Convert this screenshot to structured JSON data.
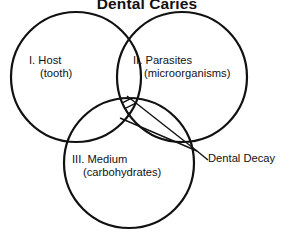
{
  "figure": {
    "title": "Dental Caries",
    "background_color": "#ffffff",
    "stroke_color": "#111111",
    "type": "venn-diagram-3-set"
  },
  "sets": [
    {
      "id": "host",
      "roman": "I.",
      "name": "Host",
      "detail": "(tooth)",
      "label_line1": "I. Host",
      "label_line2": "(tooth)",
      "position": "top-left"
    },
    {
      "id": "parasites",
      "roman": "II.",
      "name": "Parasites",
      "detail": "(microorganisms)",
      "label_line1": "II. Parasites",
      "label_line2": "(microorganisms)",
      "position": "top-right"
    },
    {
      "id": "medium",
      "roman": "III.",
      "name": "Medium",
      "detail": "(carbohydrates)",
      "label_line1": "III. Medium",
      "label_line2": "(carbohydrates)",
      "position": "bottom-center"
    }
  ],
  "annotation": {
    "label": "Dental Decay",
    "describes": "triple-intersection",
    "fill": "diagonal-hatch"
  }
}
